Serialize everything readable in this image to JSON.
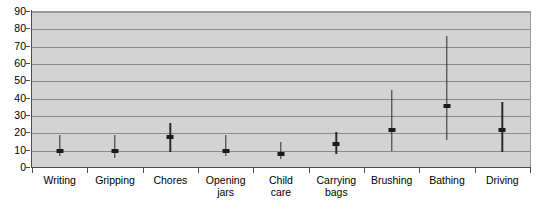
{
  "chart_data": {
    "type": "bar",
    "title": "",
    "subtitle": "",
    "xlabel": "",
    "ylabel": "",
    "ylim": [
      0,
      90
    ],
    "ytick_step": 10,
    "yticks": [
      0,
      10,
      20,
      30,
      40,
      50,
      60,
      70,
      80,
      90
    ],
    "ytick_labels": [
      "0",
      "10",
      "20",
      "30",
      "40",
      "50",
      "60",
      "70",
      "80",
      "90"
    ],
    "grid": true,
    "grid_axis": "y",
    "legend": false,
    "legend_position": "none",
    "plot_background": "#d3d3d3",
    "figure_background": "#ffffff",
    "marker_color": "#1a1a1a",
    "line_color": "#2b2b2b",
    "gridline_color": "#8a8a8a",
    "axis_color": "#4d4d4d",
    "categories": [
      "Writing",
      "Gripping",
      "Chores",
      "Opening\njars",
      "Child\ncare",
      "Carrying\nbags",
      "Brushing",
      "Bathing",
      "Driving"
    ],
    "series": [
      {
        "name": "median",
        "values": [
          10,
          10,
          18,
          10,
          8,
          14,
          22,
          36,
          22
        ]
      },
      {
        "name": "lower",
        "values": [
          7,
          6,
          9,
          7,
          5,
          8,
          10,
          16,
          9
        ]
      },
      {
        "name": "upper",
        "values": [
          19,
          19,
          26,
          19,
          15,
          21,
          45,
          76,
          38
        ]
      }
    ],
    "points": [
      {
        "category": "Writing",
        "value": 10,
        "low": 7,
        "high": 19
      },
      {
        "category": "Gripping",
        "value": 10,
        "low": 6,
        "high": 19
      },
      {
        "category": "Chores",
        "value": 18,
        "low": 9,
        "high": 26
      },
      {
        "category": "Opening jars",
        "value": 10,
        "low": 7,
        "high": 19
      },
      {
        "category": "Child care",
        "value": 8,
        "low": 5,
        "high": 15
      },
      {
        "category": "Carrying bags",
        "value": 14,
        "low": 8,
        "high": 21
      },
      {
        "category": "Brushing",
        "value": 22,
        "low": 10,
        "high": 45
      },
      {
        "category": "Bathing",
        "value": 36,
        "low": 16,
        "high": 76
      },
      {
        "category": "Driving",
        "value": 22,
        "low": 9,
        "high": 38
      }
    ]
  }
}
